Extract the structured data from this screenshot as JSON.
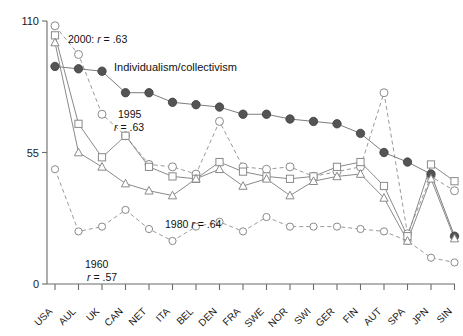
{
  "chart_data": {
    "type": "line",
    "title": "",
    "xlabel": "",
    "ylabel": "",
    "ylim": [
      0,
      110
    ],
    "yticks": [
      0,
      55,
      110
    ],
    "ytick_labels": [
      "0",
      "55",
      "110"
    ],
    "grid": false,
    "legend": "inline-annotations",
    "categories": [
      "USA",
      "AUL",
      "UK",
      "CAN",
      "NET",
      "ITA",
      "BEL",
      "DEN",
      "FRA",
      "SWE",
      "NOR",
      "SWI",
      "GER",
      "FIN",
      "AUT",
      "SPA",
      "JPN",
      "SIN"
    ],
    "series": [
      {
        "name": "Individualism/collectivism",
        "marker": "filled-circle",
        "line": "solid",
        "values": [
          91,
          90,
          89,
          80,
          80,
          76,
          75,
          74,
          71,
          71,
          69,
          68,
          67,
          63,
          55,
          51,
          46,
          20
        ]
      },
      {
        "name": "2000",
        "marker": "open-circle",
        "line": "dashed",
        "values": [
          108,
          96,
          71,
          62,
          50,
          49,
          46,
          68,
          49,
          48,
          49,
          45,
          47,
          49,
          80,
          21,
          45,
          39
        ]
      },
      {
        "name": "1995",
        "marker": "open-square",
        "line": "solid",
        "values": [
          104,
          67,
          53,
          62,
          49,
          45,
          44,
          51,
          47,
          45,
          44,
          45,
          49,
          51,
          41,
          20,
          50,
          43
        ]
      },
      {
        "name": "1980",
        "marker": "open-triangle",
        "line": "solid",
        "values": [
          101,
          55,
          49,
          42,
          39,
          37,
          44,
          48,
          41,
          44,
          37,
          43,
          45,
          46,
          36,
          18,
          44,
          19
        ]
      },
      {
        "name": "1960",
        "marker": "open-circle-small",
        "line": "dashed",
        "values": [
          48,
          22,
          24,
          31,
          23,
          18,
          24,
          26,
          22,
          28,
          24,
          24,
          24,
          23,
          22,
          18,
          11,
          9
        ]
      }
    ],
    "annotations": [
      {
        "id": "annot-2000",
        "text_prefix": "2000: ",
        "text_italic": "r",
        "text_suffix": " = .63"
      },
      {
        "id": "annot-individualism",
        "text": "Individualism/collectivism"
      },
      {
        "id": "annot-1995-line1",
        "text": "1995"
      },
      {
        "id": "annot-1995-line2",
        "text_italic": "r",
        "text_suffix": " = .63"
      },
      {
        "id": "annot-1980",
        "text_prefix": "1980 ",
        "text_italic": "r",
        "text_suffix": " = .64"
      },
      {
        "id": "annot-1960-line1",
        "text": "1960"
      },
      {
        "id": "annot-1960-line2",
        "text_italic": "r",
        "text_suffix": " = .57"
      }
    ]
  },
  "labels": {
    "ytick_110": "110",
    "ytick_55": "55",
    "ytick_0": "0",
    "x_usa": "USA",
    "x_aul": "AUL",
    "x_uk": "UK",
    "x_can": "CAN",
    "x_net": "NET",
    "x_ita": "ITA",
    "x_bel": "BEL",
    "x_den": "DEN",
    "x_fra": "FRA",
    "x_swe": "SWE",
    "x_nor": "NOR",
    "x_swi": "SWI",
    "x_ger": "GER",
    "x_fin": "FIN",
    "x_aut": "AUT",
    "x_spa": "SPA",
    "x_jpn": "JPN",
    "x_sin": "SIN"
  },
  "annotation_text": {
    "a2000_pre": "2000: ",
    "a2000_r": "r",
    "a2000_post": " = .63",
    "individualism": "Individualism/collectivism",
    "a1995_year": "1995",
    "a1995_r": "r",
    "a1995_post": " = .63",
    "a1980_pre": "1980 ",
    "a1980_r": "r",
    "a1980_post": " = .64",
    "a1960_year": "1960",
    "a1960_r": "r",
    "a1960_post": " = .57"
  },
  "colors": {
    "axis": "#6b6b6b",
    "filled_marker": "#545454",
    "open_marker_stroke": "#8a8a8a",
    "background": "#ffffff",
    "text": "#111111"
  }
}
